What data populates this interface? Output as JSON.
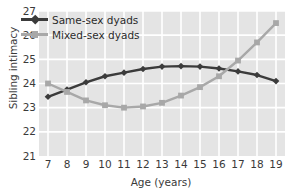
{
  "chart_data": {
    "type": "line",
    "title": "",
    "xlabel": "Age (years)",
    "ylabel": "Sibling intimacy",
    "x": [
      7,
      8,
      9,
      10,
      11,
      12,
      13,
      14,
      15,
      16,
      17,
      18,
      19
    ],
    "xticklabels": [
      "7",
      "8",
      "9",
      "10",
      "11",
      "12",
      "13",
      "14",
      "15",
      "16",
      "17",
      "18",
      "19"
    ],
    "yticklabels": [
      "21",
      "22",
      "23",
      "24",
      "25",
      "26",
      "27"
    ],
    "yticks": [
      21,
      22,
      23,
      24,
      25,
      26,
      27
    ],
    "xlim": [
      7,
      19
    ],
    "ylim": [
      21,
      27
    ],
    "grid": true,
    "legend_position": "upper-left-inside",
    "series": [
      {
        "name": "Same-sex dyads",
        "color": "#3b3b3b",
        "marker": "diamond",
        "values": [
          23.45,
          23.75,
          24.05,
          24.3,
          24.45,
          24.6,
          24.7,
          24.72,
          24.7,
          24.62,
          24.5,
          24.35,
          24.1
        ]
      },
      {
        "name": "Mixed-sex dyads",
        "color": "#a8a8a8",
        "marker": "square",
        "values": [
          24.0,
          23.65,
          23.3,
          23.1,
          23.0,
          23.05,
          23.2,
          23.5,
          23.85,
          24.3,
          24.95,
          25.7,
          26.5
        ]
      }
    ]
  },
  "style": {
    "plot_background": "#e4e4e4",
    "grid_color": "#ffffff",
    "page_background": "#ffffff",
    "tick_text_color": "#3a3a3a"
  }
}
